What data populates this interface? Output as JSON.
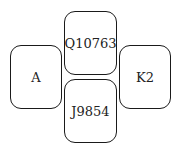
{
  "diagram": {
    "boxes": {
      "top": {
        "label": "Q10763"
      },
      "left": {
        "label": "A"
      },
      "right": {
        "label": "K2"
      },
      "bottom": {
        "label": "J9854"
      }
    }
  }
}
